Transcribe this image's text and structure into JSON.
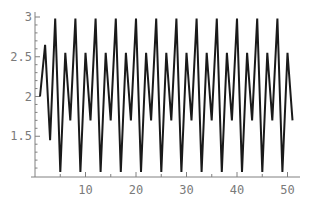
{
  "chart_data": {
    "type": "line",
    "title": "",
    "xlabel": "",
    "ylabel": "",
    "xlim": [
      0,
      52
    ],
    "ylim": [
      1.0,
      3.05
    ],
    "grid": false,
    "legend": null,
    "x_ticks": [
      10,
      20,
      30,
      40,
      50
    ],
    "x_tick_labels": [
      "10",
      "20",
      "30",
      "40",
      "50"
    ],
    "y_ticks": [
      1.5,
      2,
      2.5,
      3
    ],
    "y_tick_labels": [
      "1.5",
      "2",
      "2.5",
      "3"
    ],
    "line_color": "#1a1a1a",
    "axis_color": "#808080",
    "series": [
      {
        "name": "sequence",
        "x": [
          1,
          2,
          3,
          4,
          5,
          6,
          7,
          8,
          9,
          10,
          11,
          12,
          13,
          14,
          15,
          16,
          17,
          18,
          19,
          20,
          21,
          22,
          23,
          24,
          25,
          26,
          27,
          28,
          29,
          30,
          31,
          32,
          33,
          34,
          35,
          36,
          37,
          38,
          39,
          40,
          41,
          42,
          43,
          44,
          45,
          46,
          47,
          48,
          49,
          50,
          51
        ],
        "values": [
          2.0,
          2.65,
          1.45,
          2.98,
          1.05,
          2.55,
          1.7,
          2.98,
          1.05,
          2.55,
          1.7,
          2.98,
          1.05,
          2.55,
          1.7,
          2.98,
          1.05,
          2.55,
          1.7,
          2.98,
          1.05,
          2.55,
          1.7,
          2.98,
          1.05,
          2.55,
          1.7,
          2.98,
          1.05,
          2.55,
          1.7,
          2.98,
          1.05,
          2.55,
          1.7,
          2.98,
          1.05,
          2.55,
          1.7,
          2.98,
          1.05,
          2.55,
          1.7,
          2.98,
          1.05,
          2.55,
          1.7,
          2.98,
          1.05,
          2.55,
          1.7
        ]
      }
    ]
  }
}
